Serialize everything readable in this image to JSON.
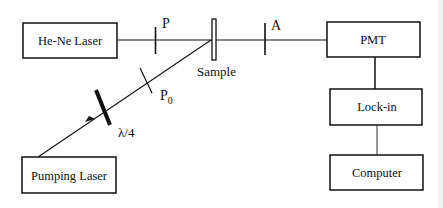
{
  "diagram": {
    "colors": {
      "line": "#111111",
      "background": "#ffffff"
    },
    "boxes": [
      {
        "id": "he-ne-laser",
        "label": "He-Ne Laser"
      },
      {
        "id": "pmt",
        "label": "PMT"
      },
      {
        "id": "lock-in",
        "label": "Lock-in"
      },
      {
        "id": "computer",
        "label": "Computer"
      },
      {
        "id": "pumping-laser",
        "label": "Pumping Laser"
      }
    ],
    "optics": {
      "polarizer": "P",
      "analyzer": "A",
      "sample": "Sample",
      "pump_polarizer": "P",
      "pump_polarizer_sub": "0",
      "waveplate": "λ/4"
    },
    "connections": [
      {
        "from": "He-Ne Laser",
        "to": "PMT",
        "via": [
          "P",
          "Sample",
          "A"
        ]
      },
      {
        "from": "Pumping Laser",
        "to": "Sample",
        "via": [
          "λ/4",
          "P0"
        ]
      },
      {
        "from": "PMT",
        "to": "Lock-in"
      },
      {
        "from": "Lock-in",
        "to": "Computer"
      }
    ]
  }
}
